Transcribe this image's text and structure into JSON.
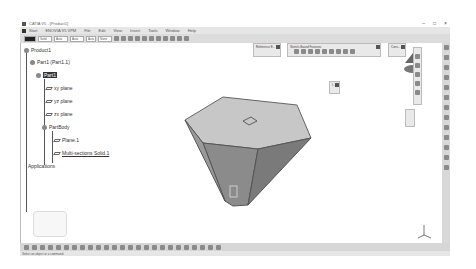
{
  "window": {
    "title": "CATIA V5 - [Product1]",
    "controls": [
      "–",
      "□",
      "×"
    ]
  },
  "menubar": {
    "items": [
      "Start",
      "ENOVIA V5 VPM",
      "File",
      "Edit",
      "View",
      "Insert",
      "Tools",
      "Window",
      "Help"
    ]
  },
  "toolbar": {
    "selects": [
      "",
      "Solid",
      "Auto",
      "Auto",
      "Auto",
      "None"
    ]
  },
  "tree": {
    "nodes": [
      {
        "label": "Product1",
        "level": 0
      },
      {
        "label": "Part1 (Part1.1)",
        "level": 1
      },
      {
        "label": "Part1",
        "level": 2,
        "selected": true
      },
      {
        "label": "xy plane",
        "level": 3
      },
      {
        "label": "yz plane",
        "level": 3
      },
      {
        "label": "zx plane",
        "level": 3
      },
      {
        "label": "PartBody",
        "level": 3
      },
      {
        "label": "Plane.1",
        "level": 4
      },
      {
        "label": "Multi-sections Solid.1",
        "level": 4,
        "underlined": true
      },
      {
        "label": "Applications",
        "level": 1
      }
    ]
  },
  "floating_toolbars": {
    "reference": "Reference E...",
    "sketch": "Sketch-Based Features",
    "constraint": "Cons...",
    "small": "I..."
  },
  "status": {
    "text": "Select an object or a command"
  },
  "colors": {
    "hex_top": "#c8c8c8",
    "hex_side": "#8a8a8a",
    "chrome": "#dcdcdc"
  }
}
